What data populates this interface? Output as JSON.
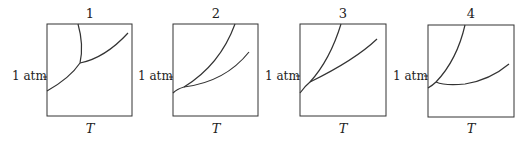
{
  "figure": {
    "panels": [
      {
        "number": "1",
        "y_label": "1 atm",
        "x_label": "T"
      },
      {
        "number": "2",
        "y_label": "1 atm",
        "x_label": "T"
      },
      {
        "number": "3",
        "y_label": "1 atm",
        "x_label": "T"
      },
      {
        "number": "4",
        "y_label": "1 atm",
        "x_label": "T"
      }
    ],
    "line_color": "#333333"
  }
}
